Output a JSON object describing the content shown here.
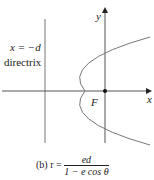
{
  "diagram": {
    "labels": {
      "y_axis": "y",
      "x_axis": "x",
      "focus": "F",
      "directrix_eq": "x = −d",
      "directrix_word": "directrix"
    },
    "caption": {
      "prefix": "(b) r =",
      "numerator": "ed",
      "denominator": "1 − e cos θ"
    },
    "colors": {
      "axes": "#333333",
      "curve": "#777777",
      "directrix": "#777777"
    }
  }
}
